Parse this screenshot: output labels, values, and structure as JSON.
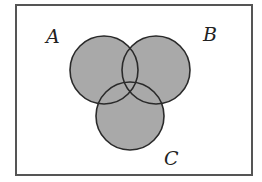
{
  "diagram": {
    "type": "venn",
    "sets": [
      {
        "label": "A",
        "cx": 104,
        "cy": 70,
        "r": 34
      },
      {
        "label": "B",
        "cx": 156,
        "cy": 70,
        "r": 34
      },
      {
        "label": "C",
        "cx": 130,
        "cy": 116,
        "r": 34
      }
    ],
    "labels": {
      "a": "A",
      "b": "B",
      "c": "C"
    },
    "colors": {
      "fill": "#a9a9a9",
      "stroke": "#2a2a2a",
      "border": "#555555",
      "background": "#ffffff"
    }
  }
}
